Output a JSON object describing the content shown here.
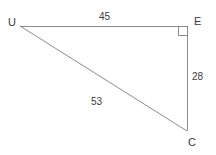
{
  "figure": {
    "kind": "right-triangle-diagram",
    "background_color": "#ffffff",
    "stroke_color": "#8c8c8c",
    "text_color": "#3a3a3a",
    "stroke_width": 1,
    "vertices": [
      {
        "name": "U",
        "label": "U",
        "x": 20,
        "y": 26,
        "label_x": 8,
        "label_y": 17
      },
      {
        "name": "E",
        "label": "E",
        "x": 187,
        "y": 26,
        "label_x": 194,
        "label_y": 16
      },
      {
        "name": "C",
        "label": "C",
        "x": 187,
        "y": 131,
        "label_x": 188,
        "label_y": 137
      }
    ],
    "sides": [
      {
        "name": "UE",
        "label": "45",
        "from": "U",
        "to": "E",
        "label_x": 99,
        "label_y": 12
      },
      {
        "name": "EC",
        "label": "28",
        "from": "E",
        "to": "C",
        "label_x": 192,
        "label_y": 72
      },
      {
        "name": "UC",
        "label": "53",
        "from": "U",
        "to": "C",
        "label_x": 91,
        "label_y": 97
      }
    ],
    "right_angle": {
      "at_vertex": "E",
      "marker": "square",
      "size": 9
    }
  }
}
